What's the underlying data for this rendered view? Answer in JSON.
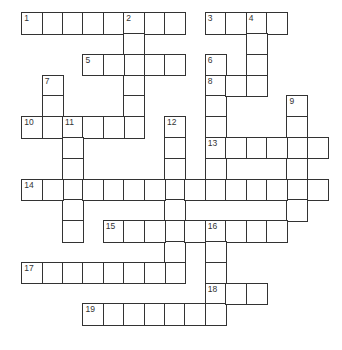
{
  "puzzle": {
    "grid": {
      "origin_x": 22,
      "origin_y": 13,
      "cell_w": 20.4,
      "cell_h": 20.8
    },
    "entries": [
      {
        "number": "1",
        "direction": "across",
        "row": 0,
        "col": 0,
        "length": 8
      },
      {
        "number": "2",
        "direction": "down",
        "row": 0,
        "col": 5,
        "length": 6
      },
      {
        "number": "3",
        "direction": "across",
        "row": 0,
        "col": 9,
        "length": 4
      },
      {
        "number": "4",
        "direction": "down",
        "row": 0,
        "col": 11,
        "length": 4
      },
      {
        "number": "5",
        "direction": "across",
        "row": 2,
        "col": 3,
        "length": 5
      },
      {
        "number": "6",
        "direction": "down",
        "row": 2,
        "col": 9,
        "length": 7
      },
      {
        "number": "7",
        "direction": "down",
        "row": 3,
        "col": 1,
        "length": 3
      },
      {
        "number": "8",
        "direction": "across",
        "row": 3,
        "col": 9,
        "length": 3
      },
      {
        "number": "9",
        "direction": "down",
        "row": 4,
        "col": 13,
        "length": 6
      },
      {
        "number": "10",
        "direction": "across",
        "row": 5,
        "col": 0,
        "length": 6
      },
      {
        "number": "11",
        "direction": "down",
        "row": 5,
        "col": 2,
        "length": 6
      },
      {
        "number": "12",
        "direction": "down",
        "row": 5,
        "col": 7,
        "length": 8
      },
      {
        "number": "13",
        "direction": "across",
        "row": 6,
        "col": 9,
        "length": 6
      },
      {
        "number": "14",
        "direction": "across",
        "row": 8,
        "col": 0,
        "length": 15
      },
      {
        "number": "15",
        "direction": "across",
        "row": 10,
        "col": 4,
        "length": 9
      },
      {
        "number": "16",
        "direction": "down",
        "row": 10,
        "col": 9,
        "length": 5
      },
      {
        "number": "17",
        "direction": "across",
        "row": 12,
        "col": 0,
        "length": 8
      },
      {
        "number": "18",
        "direction": "across",
        "row": 13,
        "col": 9,
        "length": 3
      },
      {
        "number": "19",
        "direction": "across",
        "row": 14,
        "col": 3,
        "length": 7
      }
    ]
  }
}
